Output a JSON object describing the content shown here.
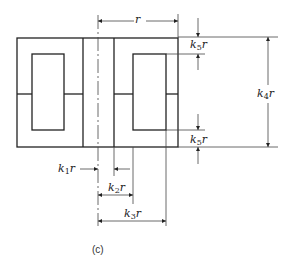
{
  "figure": {
    "caption": "(c)",
    "labels": {
      "r": {
        "var": "r"
      },
      "k1r": {
        "k": "k",
        "sub": "1",
        "var": "r"
      },
      "k2r": {
        "k": "k",
        "sub": "2",
        "var": "r"
      },
      "k3r": {
        "k": "k",
        "sub": "3",
        "var": "r"
      },
      "k4r": {
        "k": "k",
        "sub": "4",
        "var": "r"
      },
      "k5r_top": {
        "k": "k",
        "sub": "5",
        "var": "r"
      },
      "k5r_bottom": {
        "k": "k",
        "sub": "5",
        "var": "r"
      }
    },
    "colors": {
      "line": "#222222",
      "dim": "#444444",
      "background": "#ffffff"
    }
  }
}
